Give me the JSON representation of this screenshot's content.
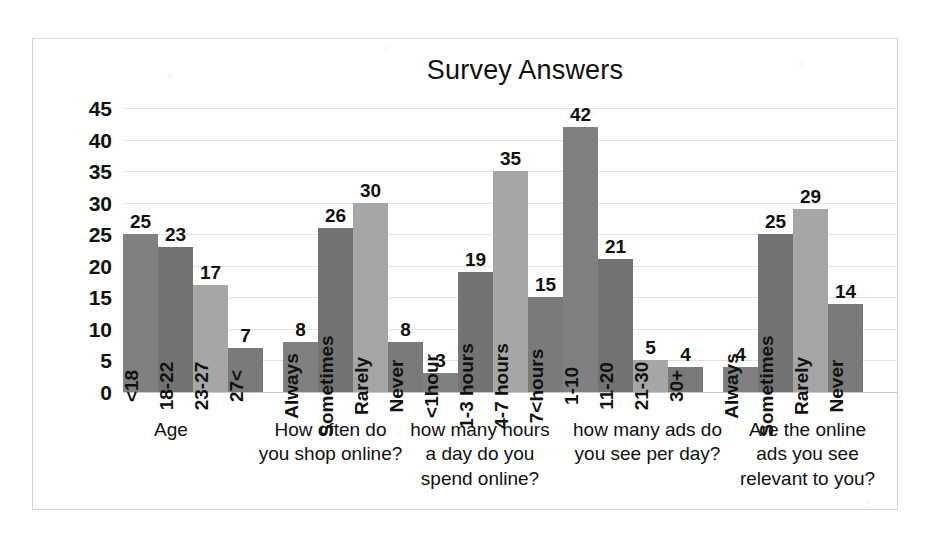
{
  "chart_data": {
    "type": "bar",
    "title": "Survey Answers",
    "xlabel": "",
    "ylabel": "",
    "ylim": [
      0,
      45
    ],
    "ytick_step": 5,
    "yticks": [
      "45",
      "40",
      "35",
      "30",
      "25",
      "20",
      "15",
      "10",
      "5",
      "0"
    ],
    "grid": true,
    "legend": "none",
    "groups": [
      {
        "question": "Age",
        "question_lines": [
          "Age"
        ],
        "categories": [
          "<18",
          "18-22",
          "23-27",
          "27<"
        ],
        "values": [
          25,
          23,
          17,
          7
        ],
        "labels": [
          "25",
          "23",
          "17",
          "7"
        ]
      },
      {
        "question": "How often do you shop online?",
        "question_lines": [
          "How often do",
          "you shop online?"
        ],
        "categories": [
          "Always",
          "Sometimes",
          "Rarely",
          "Never"
        ],
        "values": [
          8,
          26,
          30,
          8
        ],
        "labels": [
          "8",
          "26",
          "30",
          "8"
        ]
      },
      {
        "question": "how many hours a day do you spend online?",
        "question_lines": [
          "how many hours",
          "a day do you",
          "spend online?"
        ],
        "categories": [
          "<1hour",
          "1-3 hours",
          "4-7 hours",
          "7<hours"
        ],
        "values": [
          3,
          19,
          35,
          15
        ],
        "labels": [
          "3",
          "19",
          "35",
          "15"
        ]
      },
      {
        "question": "how many ads do you see per day?",
        "question_lines": [
          "how many ads do",
          "you see per day?"
        ],
        "categories": [
          "1-10",
          "11-20",
          "21-30",
          "30+"
        ],
        "values": [
          42,
          21,
          5,
          4
        ],
        "labels": [
          "42",
          "21",
          "5",
          "4"
        ]
      },
      {
        "question": "Are the online ads you see relevant to you?",
        "question_lines": [
          "Are the online",
          "ads you see",
          "relevant to you?"
        ],
        "categories": [
          "Always",
          "Sometimes",
          "Rarely",
          "Never"
        ],
        "values": [
          4,
          25,
          29,
          14
        ],
        "labels": [
          "4",
          "25",
          "29",
          "14"
        ]
      }
    ],
    "series_colors": [
      "#808080",
      "#737373",
      "#a6a6a6",
      "#7a7a7a"
    ]
  }
}
